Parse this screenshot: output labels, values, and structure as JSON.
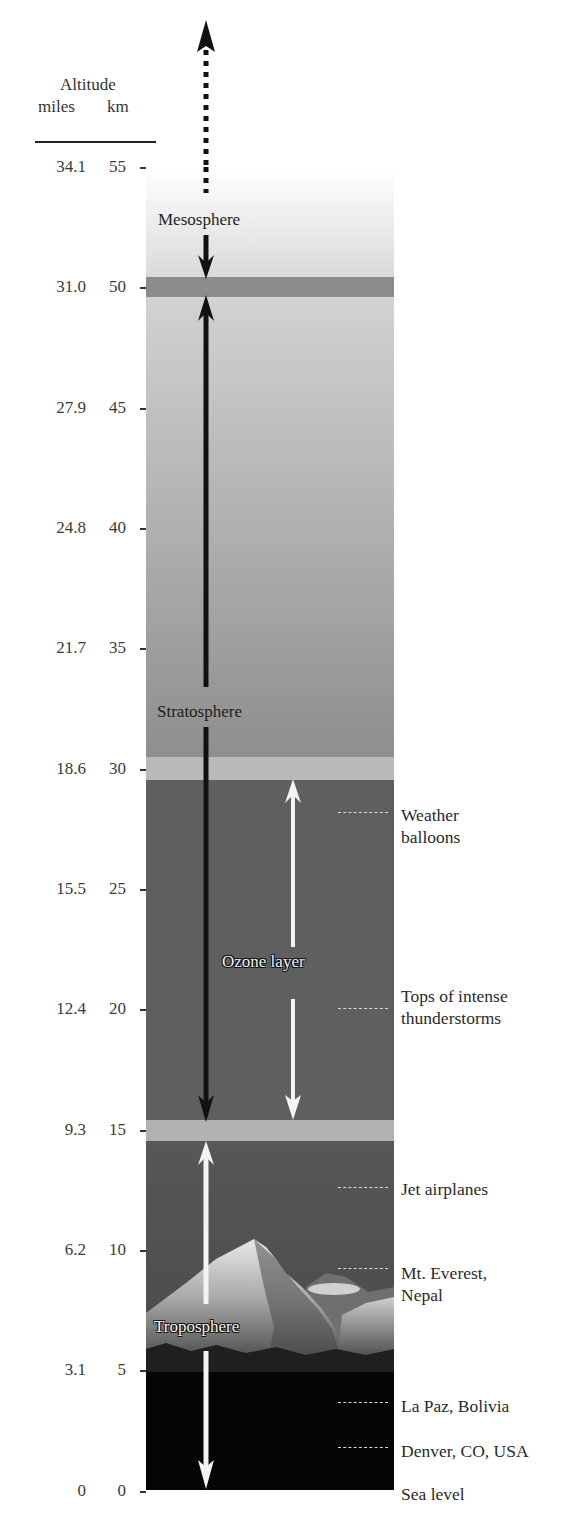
{
  "header": {
    "title": "Altitude",
    "unit_miles": "miles",
    "unit_km": "km"
  },
  "axis": {
    "ticks": [
      {
        "miles": "34.1",
        "km": "55"
      },
      {
        "miles": "31.0",
        "km": "50"
      },
      {
        "miles": "27.9",
        "km": "45"
      },
      {
        "miles": "24.8",
        "km": "40"
      },
      {
        "miles": "21.7",
        "km": "35"
      },
      {
        "miles": "18.6",
        "km": "30"
      },
      {
        "miles": "15.5",
        "km": "25"
      },
      {
        "miles": "12.4",
        "km": "20"
      },
      {
        "miles": "9.3",
        "km": "15"
      },
      {
        "miles": "6.2",
        "km": "10"
      },
      {
        "miles": "3.1",
        "km": "5"
      },
      {
        "miles": "0",
        "km": "0"
      }
    ]
  },
  "layers": {
    "mesosphere": "Mesosphere",
    "stratosphere": "Stratosphere",
    "ozone": "Ozone layer",
    "troposphere": "Troposphere"
  },
  "markers": [
    {
      "label_line1": "Weather",
      "label_line2": "balloons",
      "km": 27
    },
    {
      "label_line1": "Tops of intense",
      "label_line2": "thunderstorms",
      "km": 20
    },
    {
      "label_line1": "Jet airplanes",
      "label_line2": "",
      "km": 12
    },
    {
      "label_line1": "Mt. Everest,",
      "label_line2": "Nepal",
      "km": 8.8
    },
    {
      "label_line1": "La Paz, Bolivia",
      "label_line2": "",
      "km": 3.6
    },
    {
      "label_line1": "Denver, CO, USA",
      "label_line2": "",
      "km": 1.6
    },
    {
      "label_line1": "Sea level",
      "label_line2": "",
      "km": 0
    }
  ],
  "colors": {
    "mesosphere_top": "#ffffff",
    "mesosphere_bottom": "#d9d9d9",
    "stratopause_band": "#8a8a8a",
    "stratosphere_top": "#cfcfcf",
    "stratosphere_bottom": "#8e8e8e",
    "ozone_region": "#5e5e5e",
    "tropopause_band": "#b0b0b0",
    "troposphere_sky": "#555555",
    "ground": "#050505"
  }
}
